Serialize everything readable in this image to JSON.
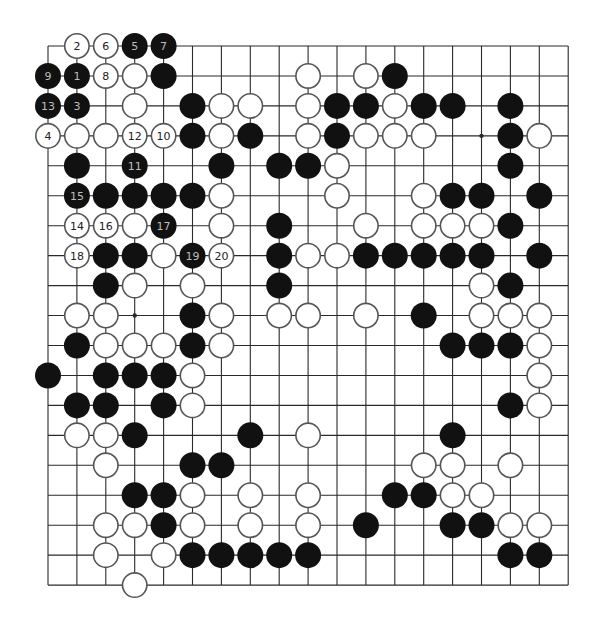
{
  "board": {
    "size": 19,
    "origin_x": 48,
    "origin_y": 46,
    "col_spacing": 28.9,
    "row_spacing": 29.95,
    "stone_radius": 13,
    "colors": {
      "black": "#111111",
      "white": "#ffffff",
      "white_border": "#555555",
      "grid": "#2a2a2a",
      "number_on_black": "#bdbdbd",
      "number_on_white": "#222222"
    },
    "star_points": [
      {
        "row": 3,
        "col": 15
      },
      {
        "row": 9,
        "col": 3
      }
    ],
    "stones": [
      {
        "row": 0,
        "col": 1,
        "color": "white",
        "label": "2"
      },
      {
        "row": 0,
        "col": 2,
        "color": "white",
        "label": "6"
      },
      {
        "row": 0,
        "col": 3,
        "color": "black",
        "label": "5"
      },
      {
        "row": 0,
        "col": 4,
        "color": "black",
        "label": "7"
      },
      {
        "row": 1,
        "col": 0,
        "color": "black",
        "label": "9"
      },
      {
        "row": 1,
        "col": 1,
        "color": "black",
        "label": "1"
      },
      {
        "row": 1,
        "col": 2,
        "color": "white",
        "label": "8"
      },
      {
        "row": 1,
        "col": 3,
        "color": "white"
      },
      {
        "row": 1,
        "col": 4,
        "color": "black"
      },
      {
        "row": 1,
        "col": 9,
        "color": "white"
      },
      {
        "row": 1,
        "col": 11,
        "color": "white"
      },
      {
        "row": 1,
        "col": 12,
        "color": "black"
      },
      {
        "row": 2,
        "col": 0,
        "color": "black",
        "label": "13"
      },
      {
        "row": 2,
        "col": 1,
        "color": "black",
        "label": "3"
      },
      {
        "row": 2,
        "col": 3,
        "color": "white"
      },
      {
        "row": 2,
        "col": 5,
        "color": "black"
      },
      {
        "row": 2,
        "col": 6,
        "color": "white"
      },
      {
        "row": 2,
        "col": 7,
        "color": "white"
      },
      {
        "row": 2,
        "col": 9,
        "color": "white"
      },
      {
        "row": 2,
        "col": 10,
        "color": "black"
      },
      {
        "row": 2,
        "col": 11,
        "color": "black"
      },
      {
        "row": 2,
        "col": 12,
        "color": "white"
      },
      {
        "row": 2,
        "col": 13,
        "color": "black"
      },
      {
        "row": 2,
        "col": 14,
        "color": "black"
      },
      {
        "row": 2,
        "col": 16,
        "color": "black"
      },
      {
        "row": 3,
        "col": 0,
        "color": "white",
        "label": "4"
      },
      {
        "row": 3,
        "col": 1,
        "color": "white"
      },
      {
        "row": 3,
        "col": 2,
        "color": "white"
      },
      {
        "row": 3,
        "col": 3,
        "color": "white",
        "label": "12"
      },
      {
        "row": 3,
        "col": 4,
        "color": "white",
        "label": "10"
      },
      {
        "row": 3,
        "col": 5,
        "color": "black"
      },
      {
        "row": 3,
        "col": 6,
        "color": "white"
      },
      {
        "row": 3,
        "col": 7,
        "color": "black"
      },
      {
        "row": 3,
        "col": 9,
        "color": "white"
      },
      {
        "row": 3,
        "col": 10,
        "color": "black"
      },
      {
        "row": 3,
        "col": 11,
        "color": "white"
      },
      {
        "row": 3,
        "col": 12,
        "color": "white"
      },
      {
        "row": 3,
        "col": 13,
        "color": "white"
      },
      {
        "row": 3,
        "col": 16,
        "color": "black"
      },
      {
        "row": 3,
        "col": 17,
        "color": "white"
      },
      {
        "row": 4,
        "col": 1,
        "color": "black"
      },
      {
        "row": 4,
        "col": 3,
        "color": "black",
        "label": "11"
      },
      {
        "row": 4,
        "col": 6,
        "color": "black"
      },
      {
        "row": 4,
        "col": 8,
        "color": "black"
      },
      {
        "row": 4,
        "col": 9,
        "color": "black"
      },
      {
        "row": 4,
        "col": 10,
        "color": "white"
      },
      {
        "row": 4,
        "col": 16,
        "color": "black"
      },
      {
        "row": 5,
        "col": 1,
        "color": "black",
        "label": "15"
      },
      {
        "row": 5,
        "col": 2,
        "color": "black"
      },
      {
        "row": 5,
        "col": 3,
        "color": "black"
      },
      {
        "row": 5,
        "col": 4,
        "color": "black"
      },
      {
        "row": 5,
        "col": 5,
        "color": "black"
      },
      {
        "row": 5,
        "col": 6,
        "color": "white"
      },
      {
        "row": 5,
        "col": 10,
        "color": "white"
      },
      {
        "row": 5,
        "col": 13,
        "color": "white"
      },
      {
        "row": 5,
        "col": 14,
        "color": "black"
      },
      {
        "row": 5,
        "col": 15,
        "color": "black"
      },
      {
        "row": 5,
        "col": 17,
        "color": "black"
      },
      {
        "row": 6,
        "col": 1,
        "color": "white",
        "label": "14"
      },
      {
        "row": 6,
        "col": 2,
        "color": "white",
        "label": "16"
      },
      {
        "row": 6,
        "col": 3,
        "color": "white"
      },
      {
        "row": 6,
        "col": 4,
        "color": "black",
        "label": "17"
      },
      {
        "row": 6,
        "col": 6,
        "color": "white"
      },
      {
        "row": 6,
        "col": 8,
        "color": "black"
      },
      {
        "row": 6,
        "col": 11,
        "color": "white"
      },
      {
        "row": 6,
        "col": 13,
        "color": "white"
      },
      {
        "row": 6,
        "col": 14,
        "color": "white"
      },
      {
        "row": 6,
        "col": 15,
        "color": "white"
      },
      {
        "row": 6,
        "col": 16,
        "color": "black"
      },
      {
        "row": 7,
        "col": 1,
        "color": "white",
        "label": "18"
      },
      {
        "row": 7,
        "col": 2,
        "color": "black"
      },
      {
        "row": 7,
        "col": 3,
        "color": "black"
      },
      {
        "row": 7,
        "col": 4,
        "color": "white"
      },
      {
        "row": 7,
        "col": 5,
        "color": "black",
        "label": "19"
      },
      {
        "row": 7,
        "col": 6,
        "color": "white",
        "label": "20"
      },
      {
        "row": 7,
        "col": 8,
        "color": "black"
      },
      {
        "row": 7,
        "col": 9,
        "color": "white"
      },
      {
        "row": 7,
        "col": 10,
        "color": "white"
      },
      {
        "row": 7,
        "col": 11,
        "color": "black"
      },
      {
        "row": 7,
        "col": 12,
        "color": "black"
      },
      {
        "row": 7,
        "col": 13,
        "color": "black"
      },
      {
        "row": 7,
        "col": 14,
        "color": "black"
      },
      {
        "row": 7,
        "col": 15,
        "color": "black"
      },
      {
        "row": 7,
        "col": 17,
        "color": "black"
      },
      {
        "row": 8,
        "col": 2,
        "color": "black"
      },
      {
        "row": 8,
        "col": 3,
        "color": "white"
      },
      {
        "row": 8,
        "col": 5,
        "color": "white"
      },
      {
        "row": 8,
        "col": 8,
        "color": "black"
      },
      {
        "row": 8,
        "col": 15,
        "color": "white"
      },
      {
        "row": 8,
        "col": 16,
        "color": "black"
      },
      {
        "row": 9,
        "col": 1,
        "color": "white"
      },
      {
        "row": 9,
        "col": 2,
        "color": "white"
      },
      {
        "row": 9,
        "col": 5,
        "color": "black"
      },
      {
        "row": 9,
        "col": 6,
        "color": "white"
      },
      {
        "row": 9,
        "col": 8,
        "color": "white"
      },
      {
        "row": 9,
        "col": 9,
        "color": "white"
      },
      {
        "row": 9,
        "col": 11,
        "color": "white"
      },
      {
        "row": 9,
        "col": 13,
        "color": "black"
      },
      {
        "row": 9,
        "col": 15,
        "color": "white"
      },
      {
        "row": 9,
        "col": 16,
        "color": "white"
      },
      {
        "row": 9,
        "col": 17,
        "color": "white"
      },
      {
        "row": 10,
        "col": 1,
        "color": "black"
      },
      {
        "row": 10,
        "col": 2,
        "color": "white"
      },
      {
        "row": 10,
        "col": 3,
        "color": "white"
      },
      {
        "row": 10,
        "col": 4,
        "color": "white"
      },
      {
        "row": 10,
        "col": 5,
        "color": "black"
      },
      {
        "row": 10,
        "col": 6,
        "color": "white"
      },
      {
        "row": 10,
        "col": 14,
        "color": "black"
      },
      {
        "row": 10,
        "col": 15,
        "color": "black"
      },
      {
        "row": 10,
        "col": 16,
        "color": "black"
      },
      {
        "row": 10,
        "col": 17,
        "color": "white"
      },
      {
        "row": 11,
        "col": 0,
        "color": "black"
      },
      {
        "row": 11,
        "col": 2,
        "color": "black"
      },
      {
        "row": 11,
        "col": 3,
        "color": "black"
      },
      {
        "row": 11,
        "col": 4,
        "color": "black"
      },
      {
        "row": 11,
        "col": 5,
        "color": "white"
      },
      {
        "row": 11,
        "col": 17,
        "color": "white"
      },
      {
        "row": 12,
        "col": 1,
        "color": "black"
      },
      {
        "row": 12,
        "col": 2,
        "color": "black"
      },
      {
        "row": 12,
        "col": 4,
        "color": "black"
      },
      {
        "row": 12,
        "col": 5,
        "color": "white"
      },
      {
        "row": 12,
        "col": 16,
        "color": "black"
      },
      {
        "row": 12,
        "col": 17,
        "color": "white"
      },
      {
        "row": 13,
        "col": 1,
        "color": "white"
      },
      {
        "row": 13,
        "col": 2,
        "color": "white"
      },
      {
        "row": 13,
        "col": 3,
        "color": "black"
      },
      {
        "row": 13,
        "col": 7,
        "color": "black"
      },
      {
        "row": 13,
        "col": 9,
        "color": "white"
      },
      {
        "row": 13,
        "col": 14,
        "color": "black"
      },
      {
        "row": 14,
        "col": 2,
        "color": "white"
      },
      {
        "row": 14,
        "col": 5,
        "color": "black"
      },
      {
        "row": 14,
        "col": 6,
        "color": "black"
      },
      {
        "row": 14,
        "col": 13,
        "color": "white"
      },
      {
        "row": 14,
        "col": 14,
        "color": "white"
      },
      {
        "row": 14,
        "col": 16,
        "color": "white"
      },
      {
        "row": 15,
        "col": 3,
        "color": "black"
      },
      {
        "row": 15,
        "col": 4,
        "color": "black"
      },
      {
        "row": 15,
        "col": 5,
        "color": "white"
      },
      {
        "row": 15,
        "col": 7,
        "color": "white"
      },
      {
        "row": 15,
        "col": 9,
        "color": "white"
      },
      {
        "row": 15,
        "col": 12,
        "color": "black"
      },
      {
        "row": 15,
        "col": 13,
        "color": "black"
      },
      {
        "row": 15,
        "col": 14,
        "color": "white"
      },
      {
        "row": 15,
        "col": 15,
        "color": "white"
      },
      {
        "row": 16,
        "col": 2,
        "color": "white"
      },
      {
        "row": 16,
        "col": 3,
        "color": "white"
      },
      {
        "row": 16,
        "col": 4,
        "color": "black"
      },
      {
        "row": 16,
        "col": 5,
        "color": "white"
      },
      {
        "row": 16,
        "col": 7,
        "color": "white"
      },
      {
        "row": 16,
        "col": 9,
        "color": "white"
      },
      {
        "row": 16,
        "col": 11,
        "color": "black"
      },
      {
        "row": 16,
        "col": 14,
        "color": "black"
      },
      {
        "row": 16,
        "col": 15,
        "color": "black"
      },
      {
        "row": 16,
        "col": 16,
        "color": "white"
      },
      {
        "row": 16,
        "col": 17,
        "color": "white"
      },
      {
        "row": 17,
        "col": 2,
        "color": "white"
      },
      {
        "row": 17,
        "col": 4,
        "color": "white"
      },
      {
        "row": 17,
        "col": 5,
        "color": "black"
      },
      {
        "row": 17,
        "col": 6,
        "color": "black"
      },
      {
        "row": 17,
        "col": 7,
        "color": "black"
      },
      {
        "row": 17,
        "col": 8,
        "color": "black"
      },
      {
        "row": 17,
        "col": 9,
        "color": "black"
      },
      {
        "row": 17,
        "col": 16,
        "color": "black"
      },
      {
        "row": 17,
        "col": 17,
        "color": "black"
      },
      {
        "row": 18,
        "col": 3,
        "color": "white"
      }
    ]
  }
}
